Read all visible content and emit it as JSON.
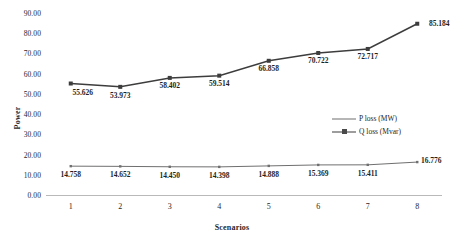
{
  "chart_data": {
    "type": "line",
    "title": "",
    "xlabel": "Scenarios",
    "ylabel": "Power",
    "categories": [
      "1",
      "2",
      "3",
      "4",
      "5",
      "6",
      "7",
      "8"
    ],
    "ylim": [
      0,
      90
    ],
    "yticks": [
      "0.00",
      "10.00",
      "20.00",
      "30.00",
      "40.00",
      "50.00",
      "60.00",
      "70.00",
      "80.00",
      "90.00"
    ],
    "ytick_values": [
      0,
      10,
      20,
      30,
      40,
      50,
      60,
      70,
      80,
      90
    ],
    "grid": false,
    "legend_position": "center-right",
    "series": [
      {
        "name": "P loss (MW)",
        "values": [
          14.758,
          14.652,
          14.45,
          14.398,
          14.888,
          15.369,
          15.411,
          16.776
        ],
        "labels": [
          "14.758",
          "14.652",
          "14.450",
          "14.398",
          "14.888",
          "15.369",
          "15.411",
          "16.776"
        ],
        "color": "#6f6f6f"
      },
      {
        "name": "Q loss (Mvar)",
        "values": [
          55.626,
          53.973,
          58.402,
          59.514,
          66.858,
          70.722,
          72.717,
          85.184
        ],
        "labels": [
          "55.626",
          "53.973",
          "58.402",
          "59.514",
          "66.858",
          "70.722",
          "72.717",
          "85.184"
        ],
        "color": "#3d3d3d"
      }
    ]
  }
}
